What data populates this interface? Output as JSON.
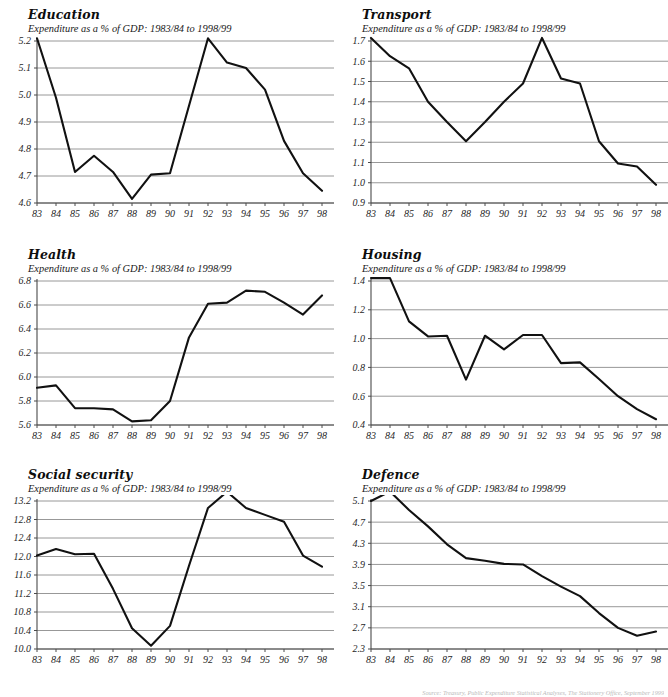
{
  "page": {
    "subtitle_common": "Expenditure as a % of GDP: 1983/84 to 1998/99",
    "source_note": "Source: Treasury, Public Expenditure Statistical Analyses, The Stationery Office, September 1999",
    "line_color": "#111111",
    "gridline_color": "#8c8c8c",
    "axis_color": "#4a4a4a"
  },
  "charts": [
    {
      "id": "education",
      "title": "Education",
      "subtitle": "Expenditure as a % of GDP: 1983/84 to 1998/99",
      "chart_data": {
        "type": "line",
        "title": "Education",
        "xlabel": "",
        "ylabel": "",
        "grid": true,
        "legend": "none",
        "categories": [
          "83",
          "84",
          "85",
          "86",
          "87",
          "88",
          "89",
          "90",
          "91",
          "92",
          "93",
          "94",
          "95",
          "96",
          "97",
          "98"
        ],
        "values": [
          5.21,
          4.99,
          4.715,
          4.775,
          4.715,
          4.615,
          4.705,
          4.71,
          4.96,
          5.21,
          5.12,
          5.1,
          5.02,
          4.83,
          4.71,
          4.645
        ],
        "ylim": [
          4.6,
          5.2
        ],
        "yticks": [
          "4.6",
          "4.7",
          "4.8",
          "4.9",
          "5.0",
          "5.1",
          "5.2"
        ],
        "ytickvals": [
          4.6,
          4.7,
          4.8,
          4.9,
          5.0,
          5.1,
          5.2
        ]
      }
    },
    {
      "id": "transport",
      "title": "Transport",
      "subtitle": "Expenditure as a % of GDP: 1983/84 to 1998/99",
      "chart_data": {
        "type": "line",
        "title": "Transport",
        "xlabel": "",
        "ylabel": "",
        "grid": true,
        "legend": "none",
        "categories": [
          "83",
          "84",
          "85",
          "86",
          "87",
          "88",
          "89",
          "90",
          "91",
          "92",
          "93",
          "94",
          "95",
          "96",
          "97",
          "98"
        ],
        "values": [
          1.715,
          1.625,
          1.565,
          1.4,
          1.3,
          1.205,
          1.3,
          1.4,
          1.49,
          1.715,
          1.515,
          1.49,
          1.205,
          1.095,
          1.08,
          0.99
        ],
        "ylim": [
          0.9,
          1.7
        ],
        "yticks": [
          "0.9",
          "1.0",
          "1.1",
          "1.2",
          "1.3",
          "1.4",
          "1.5",
          "1.6",
          "1.7"
        ],
        "ytickvals": [
          0.9,
          1.0,
          1.1,
          1.2,
          1.3,
          1.4,
          1.5,
          1.6,
          1.7
        ]
      }
    },
    {
      "id": "health",
      "title": "Health",
      "subtitle": "Expenditure as a % of GDP: 1983/84 to 1998/99",
      "chart_data": {
        "type": "line",
        "title": "Health",
        "xlabel": "",
        "ylabel": "",
        "grid": true,
        "legend": "none",
        "categories": [
          "83",
          "84",
          "85",
          "86",
          "87",
          "88",
          "89",
          "90",
          "91",
          "92",
          "93",
          "94",
          "95",
          "96",
          "97",
          "98"
        ],
        "values": [
          5.91,
          5.93,
          5.74,
          5.74,
          5.73,
          5.63,
          5.64,
          5.8,
          6.33,
          6.61,
          6.62,
          6.72,
          6.71,
          6.62,
          6.52,
          6.68
        ],
        "ylim": [
          5.6,
          6.8
        ],
        "yticks": [
          "5.6",
          "5.8",
          "6.0",
          "6.2",
          "6.4",
          "6.6",
          "6.8"
        ],
        "ytickvals": [
          5.6,
          5.8,
          6.0,
          6.2,
          6.4,
          6.6,
          6.8
        ]
      }
    },
    {
      "id": "housing",
      "title": "Housing",
      "subtitle": "Expenditure as a % of GDP: 1983/84 to 1998/99",
      "chart_data": {
        "type": "line",
        "title": "Housing",
        "xlabel": "",
        "ylabel": "",
        "grid": true,
        "legend": "none",
        "categories": [
          "83",
          "84",
          "85",
          "86",
          "87",
          "88",
          "89",
          "90",
          "91",
          "92",
          "93",
          "94",
          "95",
          "96",
          "97",
          "98"
        ],
        "values": [
          1.42,
          1.42,
          1.12,
          1.015,
          1.02,
          0.715,
          1.02,
          0.925,
          1.025,
          1.025,
          0.83,
          0.835,
          0.72,
          0.6,
          0.51,
          0.44
        ],
        "ylim": [
          0.4,
          1.4
        ],
        "yticks": [
          "0.4",
          "0.6",
          "0.8",
          "1.0",
          "1.2",
          "1.4"
        ],
        "ytickvals": [
          0.4,
          0.6,
          0.8,
          1.0,
          1.2,
          1.4
        ]
      }
    },
    {
      "id": "social-security",
      "title": "Social security",
      "subtitle": "Expenditure as a % of GDP: 1983/84 to 1998/99",
      "chart_data": {
        "type": "line",
        "title": "Social security",
        "xlabel": "",
        "ylabel": "",
        "grid": true,
        "legend": "none",
        "categories": [
          "83",
          "84",
          "85",
          "86",
          "87",
          "88",
          "89",
          "90",
          "91",
          "92",
          "93",
          "94",
          "95",
          "96",
          "97",
          "98"
        ],
        "values": [
          12.02,
          12.16,
          12.05,
          12.06,
          11.3,
          10.45,
          10.07,
          10.5,
          11.8,
          13.05,
          13.4,
          13.05,
          12.9,
          12.75,
          12.02,
          11.78
        ],
        "ylim": [
          10.0,
          13.2
        ],
        "yticks": [
          "10.0",
          "10.4",
          "10.8",
          "11.2",
          "11.6",
          "12.0",
          "12.4",
          "12.8",
          "13.2"
        ],
        "ytickvals": [
          10.0,
          10.4,
          10.8,
          11.2,
          11.6,
          12.0,
          12.4,
          12.8,
          13.2
        ]
      }
    },
    {
      "id": "defence",
      "title": "Defence",
      "subtitle": "Expenditure as a % of GDP: 1983/84 to 1998/99",
      "chart_data": {
        "type": "line",
        "title": "Defence",
        "xlabel": "",
        "ylabel": "",
        "grid": true,
        "legend": "none",
        "categories": [
          "83",
          "84",
          "85",
          "86",
          "87",
          "88",
          "89",
          "90",
          "91",
          "92",
          "93",
          "94",
          "95",
          "96",
          "97",
          "98"
        ],
        "values": [
          5.1,
          5.28,
          4.93,
          4.62,
          4.28,
          4.02,
          3.97,
          3.91,
          3.9,
          3.68,
          3.48,
          3.3,
          2.98,
          2.7,
          2.55,
          2.63
        ],
        "ylim": [
          2.3,
          5.1
        ],
        "yticks": [
          "2.3",
          "2.7",
          "3.1",
          "3.5",
          "3.9",
          "4.3",
          "4.7",
          "5.1"
        ],
        "ytickvals": [
          2.3,
          2.7,
          3.1,
          3.5,
          3.9,
          4.3,
          4.7,
          5.1
        ]
      }
    }
  ]
}
